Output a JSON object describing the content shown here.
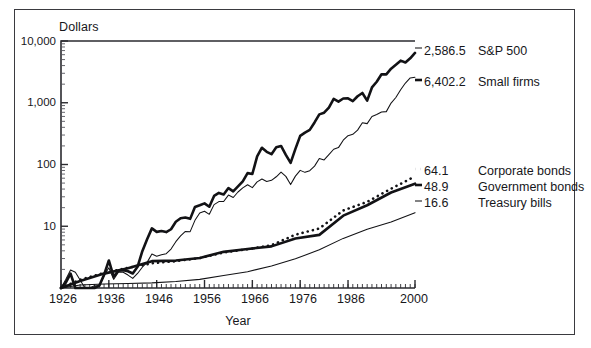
{
  "figure": {
    "y_axis_title": "Dollars",
    "x_axis_title": "Year"
  },
  "chart_data": {
    "type": "line",
    "title": "",
    "subtitle": "",
    "xlabel": "Year",
    "ylabel": "Dollars",
    "xlim": [
      1926,
      2000
    ],
    "ylim": [
      1,
      10000
    ],
    "yscale": "log",
    "grid": false,
    "legend_position": "right-of-axes",
    "xticks": [
      1926,
      1936,
      1946,
      1956,
      1966,
      1976,
      1986,
      2000
    ],
    "xticklabels": [
      "1926",
      "1936",
      "1946",
      "1956",
      "1966",
      "1976",
      "1986",
      "2000"
    ],
    "yticks": [
      10,
      100,
      1000,
      10000
    ],
    "yticklabels": [
      "10",
      "100",
      "1,000",
      "10,000"
    ],
    "series": [
      {
        "name": "Small firms",
        "end_value": "6,402.2",
        "end_value_number": 6402.2,
        "style": "thick-solid",
        "x": [
          1926,
          1927,
          1928,
          1929,
          1930,
          1931,
          1932,
          1933,
          1934,
          1935,
          1936,
          1937,
          1938,
          1939,
          1940,
          1941,
          1942,
          1943,
          1944,
          1945,
          1946,
          1947,
          1948,
          1949,
          1950,
          1951,
          1952,
          1953,
          1954,
          1955,
          1956,
          1957,
          1958,
          1959,
          1960,
          1961,
          1962,
          1963,
          1964,
          1965,
          1966,
          1967,
          1968,
          1969,
          1970,
          1971,
          1972,
          1973,
          1974,
          1975,
          1976,
          1977,
          1978,
          1979,
          1980,
          1981,
          1982,
          1983,
          1984,
          1985,
          1986,
          1987,
          1988,
          1989,
          1990,
          1991,
          1992,
          1993,
          1994,
          1995,
          1996,
          1997,
          1998,
          1999,
          2000
        ],
        "y": [
          1.0,
          1.22,
          1.71,
          1.0,
          0.6,
          0.33,
          0.35,
          0.9,
          1.09,
          1.63,
          2.79,
          1.53,
          1.9,
          1.94,
          1.87,
          1.72,
          2.2,
          3.95,
          6.15,
          9.24,
          8.11,
          8.36,
          8.04,
          8.94,
          11.8,
          13.5,
          13.85,
          13.17,
          20.48,
          21.87,
          23.49,
          20.69,
          30.96,
          34.65,
          32.76,
          41.52,
          36.72,
          44.13,
          53.42,
          72.54,
          70.1,
          135.44,
          186.85,
          160.53,
          147.04,
          190.22,
          199.6,
          143.16,
          106.25,
          179.15,
          290.8,
          328.61,
          363.48,
          479.83,
          648.66,
          690.75,
          837.49,
          1155.39,
          1044.17,
          1172.03,
          1180.37,
          1063.01,
          1275.16,
          1438.87,
          1081.94,
          1768.24,
          2187.52,
          2886.88,
          2881.44,
          3565.08,
          4123.6,
          4803.62,
          4475.2,
          5250.0,
          6402.2
        ]
      },
      {
        "name": "S&P 500",
        "end_value": "2,586.5",
        "end_value_number": 2586.5,
        "style": "thin-solid",
        "x": [
          1926,
          1927,
          1928,
          1929,
          1930,
          1931,
          1932,
          1933,
          1934,
          1935,
          1936,
          1937,
          1938,
          1939,
          1940,
          1941,
          1942,
          1943,
          1944,
          1945,
          1946,
          1947,
          1948,
          1949,
          1950,
          1951,
          1952,
          1953,
          1954,
          1955,
          1956,
          1957,
          1958,
          1959,
          1960,
          1961,
          1962,
          1963,
          1964,
          1965,
          1966,
          1967,
          1968,
          1969,
          1970,
          1971,
          1972,
          1973,
          1974,
          1975,
          1976,
          1977,
          1978,
          1979,
          1980,
          1981,
          1982,
          1983,
          1984,
          1985,
          1986,
          1987,
          1988,
          1989,
          1990,
          1991,
          1992,
          1993,
          1994,
          1995,
          1996,
          1997,
          1998,
          1999,
          2000
        ],
        "y": [
          1.0,
          1.37,
          1.96,
          1.8,
          1.35,
          0.77,
          0.71,
          1.09,
          1.08,
          1.59,
          2.13,
          1.38,
          1.81,
          1.8,
          1.62,
          1.43,
          1.72,
          2.17,
          2.6,
          3.55,
          3.26,
          3.45,
          3.59,
          4.27,
          5.62,
          6.97,
          8.25,
          8.17,
          12.47,
          16.41,
          17.49,
          15.6,
          22.4,
          25.08,
          25.2,
          31.98,
          29.18,
          35.84,
          41.77,
          46.97,
          42.23,
          52.34,
          58.14,
          53.16,
          55.36,
          63.29,
          75.3,
          64.24,
          47.24,
          64.84,
          80.33,
          74.59,
          79.5,
          94.19,
          124.75,
          118.6,
          144.08,
          176.56,
          187.68,
          247.22,
          293.17,
          308.52,
          359.83,
          473.74,
          458.95,
          598.71,
          644.4,
          709.21,
          718.47,
          988.37,
          1215.0,
          1620.0,
          2084.0,
          2523.0,
          2586.5
        ]
      },
      {
        "name": "Corporate bonds",
        "end_value": "64.1",
        "end_value_number": 64.1,
        "style": "dotted",
        "x": [
          1926,
          1930,
          1935,
          1940,
          1945,
          1950,
          1955,
          1960,
          1965,
          1970,
          1975,
          1980,
          1985,
          1990,
          1995,
          2000
        ],
        "y": [
          1.0,
          1.36,
          1.76,
          2.12,
          2.51,
          2.72,
          3.05,
          3.76,
          4.24,
          4.94,
          7.3,
          9.21,
          18.03,
          24.87,
          40.5,
          64.1
        ]
      },
      {
        "name": "Government bonds",
        "end_value": "48.9",
        "end_value_number": 48.9,
        "style": "thick-solid",
        "x": [
          1926,
          1930,
          1935,
          1940,
          1945,
          1950,
          1955,
          1960,
          1965,
          1970,
          1975,
          1980,
          1985,
          1990,
          1995,
          2000
        ],
        "y": [
          1.0,
          1.3,
          1.71,
          2.09,
          2.72,
          2.78,
          3.07,
          3.85,
          4.28,
          4.72,
          6.35,
          7.25,
          14.85,
          21.9,
          35.2,
          48.9
        ]
      },
      {
        "name": "Treasury bills",
        "end_value": "16.6",
        "end_value_number": 16.6,
        "style": "thin-solid",
        "x": [
          1926,
          1930,
          1935,
          1940,
          1945,
          1950,
          1955,
          1960,
          1965,
          1970,
          1975,
          1980,
          1985,
          1990,
          1995,
          2000
        ],
        "y": [
          1.0,
          1.12,
          1.16,
          1.18,
          1.21,
          1.27,
          1.38,
          1.6,
          1.84,
          2.28,
          2.97,
          4.15,
          6.36,
          8.97,
          11.7,
          16.6
        ]
      }
    ],
    "legend_entries": [
      {
        "value": "2,586.5",
        "name": "S&P 500"
      },
      {
        "value": "6,402.2",
        "name": "Small firms"
      },
      {
        "value": "64.1",
        "name": "Corporate bonds"
      },
      {
        "value": "48.9",
        "name": "Government bonds"
      },
      {
        "value": "16.6",
        "name": "Treasury bills"
      }
    ]
  }
}
